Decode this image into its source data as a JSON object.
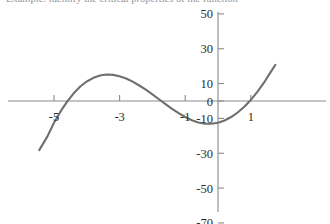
{
  "caption": {
    "text": "Example: identify the critical properties of the function"
  },
  "chart_data": {
    "type": "line",
    "title": "",
    "subtitle": "",
    "xlabel": "",
    "ylabel": "",
    "xlim": [
      -5.6,
      1.9
    ],
    "ylim": [
      -72,
      56
    ],
    "grid": false,
    "legend": null,
    "legend_position": "none",
    "x_ticks": [
      -5,
      -3,
      -1,
      1
    ],
    "x_tick_labels": [
      "-5",
      "-3",
      "-1",
      "1"
    ],
    "y_ticks": [
      50,
      30,
      10,
      0,
      -10,
      -30,
      -50,
      -70
    ],
    "y_tick_labels": [
      "50",
      "30",
      "10",
      "0",
      "-10",
      "-30",
      "-50",
      "-70"
    ],
    "axis_color": "#8a8a8a",
    "curve_color": "#6f6f6f",
    "curve_width": 2.1,
    "function_label": "y = x^3 + 4.5x^2",
    "series": [
      {
        "name": "cubic",
        "color": "#6f6f6f",
        "x": [
          -5.45,
          -5.2,
          -5.0,
          -4.8,
          -4.6,
          -4.4,
          -4.2,
          -4.0,
          -3.8,
          -3.6,
          -3.4,
          -3.2,
          -3.0,
          -2.8,
          -2.6,
          -2.4,
          -2.2,
          -2.0,
          -1.8,
          -1.6,
          -1.4,
          -1.2,
          -1.0,
          -0.8,
          -0.6,
          -0.4,
          -0.2,
          0.0,
          0.2,
          0.4,
          0.6,
          0.8,
          1.0,
          1.2,
          1.4,
          1.6,
          1.75
        ],
        "y": [
          -28.2,
          -20.3,
          -12.5,
          -6.0,
          -0.4,
          4.4,
          8.3,
          11.2,
          13.3,
          14.6,
          15.2,
          15.0,
          14.2,
          12.9,
          11.1,
          8.9,
          6.5,
          3.8,
          1.0,
          -1.8,
          -4.5,
          -7.0,
          -9.2,
          -11.0,
          -12.3,
          -13.0,
          -13.1,
          -12.5,
          -11.2,
          -9.2,
          -6.6,
          -3.3,
          0.6,
          5.2,
          10.5,
          16.4,
          20.8
        ],
        "note": "pixel-traced cubic with double root at x=0, local max approx 13 near x=-2.4, falls to -70 near x=-4.5"
      }
    ],
    "features": {
      "x_intercepts": [
        -3.4,
        0
      ],
      "local_maximum": {
        "x": -2.4,
        "y": 13
      },
      "local_minimum": {
        "x": 0,
        "y": 0
      },
      "y_intercept": 0,
      "end_behavior_left": "decreasing to -70",
      "end_behavior_right": "increasing to 50"
    }
  }
}
